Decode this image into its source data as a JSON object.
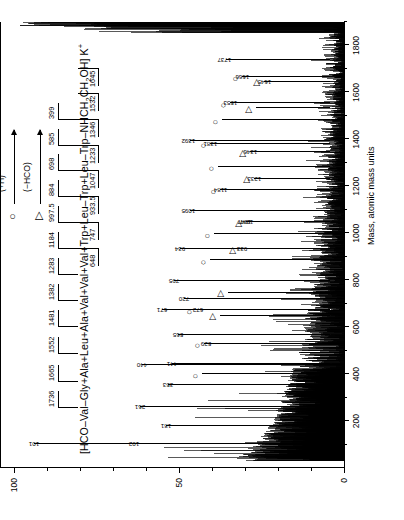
{
  "figure": {
    "type": "mass-spectrum",
    "orientation": "rotated-90-ccw"
  },
  "axes": {
    "x": {
      "title": "Mass, atomic mass units",
      "ticks": [
        200,
        400,
        600,
        800,
        1000,
        1200,
        1400,
        1600,
        1800
      ],
      "tick_labels": [
        "200",
        "400",
        "600",
        "800",
        "1000",
        "1200",
        "1400",
        "1600",
        "1800"
      ],
      "min": 0,
      "max": 1900
    },
    "y": {
      "title": "Relative intensity",
      "ticks": [
        0,
        50,
        100
      ],
      "tick_labels": [
        "0",
        "50",
        "100"
      ],
      "min": 0,
      "max": 100
    }
  },
  "legend": {
    "items": [
      {
        "symbol": "circle",
        "glyph": "○",
        "label": "(+H)"
      },
      {
        "symbol": "triangle",
        "glyph": "▷",
        "label": "(−HCO)"
      }
    ]
  },
  "sequence": {
    "text": "[HCO–Val–Gly+Ala+Leu+Ala+Val+Val+Val+Trp+Leu–Trp+Leu–Trp–NHCH2CH2OH] K+",
    "formula_html": "[HCO&ndash;Val&ndash;Gly+Ala+Leu+Ala+Val+Val+Val+Trp+Leu&ndash;Trp+Leu&ndash;Trp&ndash;NHCH<sub>2</sub>CH<sub>2</sub>OH] K<sup>+</sup>",
    "n_terminal_series": [
      "1736",
      "1665",
      "1552",
      "1481",
      "1382",
      "1283",
      "1184",
      "997.5",
      "884",
      "698",
      "585",
      "399"
    ],
    "c_terminal_series": [
      "648",
      "747",
      "933.5",
      "1047",
      "1233",
      "1346",
      "1532",
      "1645"
    ]
  },
  "chart_data": {
    "type": "line",
    "title": "",
    "xlabel": "Mass, atomic mass units",
    "ylabel": "Relative intensity",
    "xlim": [
      0,
      1900
    ],
    "ylim": [
      0,
      100
    ],
    "grid": false,
    "legend_position": "top-right",
    "annotated_peaks": [
      {
        "mass": 101,
        "label": "101",
        "symbol": "none"
      },
      {
        "mass": 102,
        "label": "102",
        "symbol": "none"
      },
      {
        "mass": 181,
        "label": "181",
        "symbol": "none"
      },
      {
        "mass": 261,
        "label": "261",
        "symbol": "none"
      },
      {
        "mass": 353,
        "label": "353",
        "symbol": "none"
      },
      {
        "mass": 399,
        "label": "",
        "symbol": "circle"
      },
      {
        "mass": 440,
        "label": "440",
        "symbol": "none"
      },
      {
        "mass": 441,
        "label": "441",
        "symbol": "none"
      },
      {
        "mass": 529,
        "label": "529",
        "symbol": "circle"
      },
      {
        "mass": 565,
        "label": "565",
        "symbol": "none"
      },
      {
        "mass": 648,
        "label": "",
        "symbol": "triangle"
      },
      {
        "mass": 671,
        "label": "671",
        "symbol": "none"
      },
      {
        "mass": 672,
        "label": "672",
        "symbol": "circle"
      },
      {
        "mass": 720,
        "label": "720",
        "symbol": "none"
      },
      {
        "mass": 747,
        "label": "",
        "symbol": "triangle"
      },
      {
        "mass": 795,
        "label": "795",
        "symbol": "none"
      },
      {
        "mass": 884,
        "label": "",
        "symbol": "circle"
      },
      {
        "mass": 933,
        "label": "933",
        "symbol": "triangle"
      },
      {
        "mass": 934,
        "label": "934",
        "symbol": "none"
      },
      {
        "mass": 997,
        "label": "",
        "symbol": "circle"
      },
      {
        "mass": 1047,
        "label": "1047",
        "symbol": "triangle"
      },
      {
        "mass": 1047,
        "label": "1047",
        "symbol": "none"
      },
      {
        "mass": 1095,
        "label": "1095",
        "symbol": "none"
      },
      {
        "mass": 1184,
        "label": "1184",
        "symbol": "circle"
      },
      {
        "mass": 1233,
        "label": "1233",
        "symbol": "triangle"
      },
      {
        "mass": 1283,
        "label": "",
        "symbol": "circle"
      },
      {
        "mass": 1346,
        "label": "1346",
        "symbol": "triangle"
      },
      {
        "mass": 1381,
        "label": "1381",
        "symbol": "circle"
      },
      {
        "mass": 1392,
        "label": "1392",
        "symbol": "none"
      },
      {
        "mass": 1481,
        "label": "",
        "symbol": "circle"
      },
      {
        "mass": 1532,
        "label": "",
        "symbol": "triangle"
      },
      {
        "mass": 1553,
        "label": "1553",
        "symbol": "circle"
      },
      {
        "mass": 1645,
        "label": "1645",
        "symbol": "triangle"
      },
      {
        "mass": 1666,
        "label": "1666",
        "symbol": "circle"
      },
      {
        "mass": 1737,
        "label": "1737",
        "symbol": "none"
      }
    ]
  }
}
